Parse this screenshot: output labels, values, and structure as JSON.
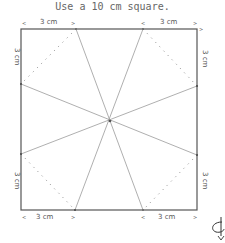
{
  "title": "Use a 10 cm square.",
  "labels": {
    "top_left": "3 cm",
    "top_right": "3 cm",
    "left_top": "3 cm",
    "left_bottom": "3 cm",
    "right_top": "3 cm",
    "right_bottom": "3 cm",
    "bottom_left": "3 cm",
    "bottom_right": "3 cm"
  },
  "icons": {
    "turn_over": "turn-over-icon"
  },
  "colors": {
    "square": "#555555",
    "fold_lines": "#999999",
    "dotted_lines": "#888888",
    "text": "#666666"
  }
}
